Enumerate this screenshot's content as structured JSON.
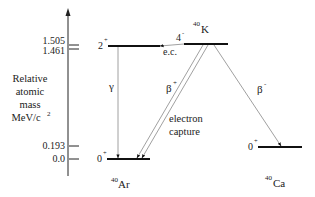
{
  "axis": {
    "label_lines": [
      "Relative",
      "atomic",
      "mass",
      "MeV/c"
    ],
    "label_superscript": "2",
    "ticks": [
      "1.505",
      "1.461",
      "0.193",
      "0.0"
    ]
  },
  "nuclides": {
    "ar": {
      "mass": "40",
      "symbol": "Ar"
    },
    "k": {
      "mass": "40",
      "symbol": "K"
    },
    "ca": {
      "mass": "40",
      "symbol": "Ca"
    }
  },
  "levels": {
    "ar_excited": {
      "spin": "2",
      "parity": "+"
    },
    "ar_ground": {
      "spin": "0",
      "parity": "+"
    },
    "k_ground": {
      "spin": "4",
      "parity": "-"
    },
    "ca_ground": {
      "spin": "0",
      "parity": "+"
    }
  },
  "transitions": {
    "gamma": "γ",
    "ec_short": "e.c.",
    "beta_plus": {
      "symbol": "β",
      "sign": "+"
    },
    "beta_minus": {
      "symbol": "β",
      "sign": "-"
    },
    "electron_capture": [
      "electron",
      "capture"
    ]
  },
  "colors": {
    "level": "#111111",
    "line": "#888888",
    "text": "#222222"
  }
}
